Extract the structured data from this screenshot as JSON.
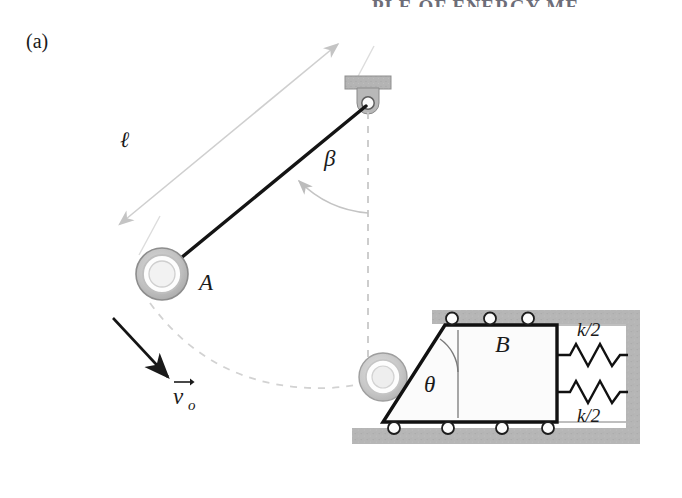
{
  "figure": {
    "panel_label": "(a)",
    "header_fragment": "PLE OF ENERGY ME",
    "caption_note": ""
  },
  "labels": {
    "length": "ℓ",
    "beta": "β",
    "theta": "θ",
    "ball": "A",
    "block": "B",
    "velocity": "v",
    "velocity_subscript": "o",
    "spring_top": "k/2",
    "spring_bottom": "k/2"
  },
  "colors": {
    "ink": "#1a1a1a",
    "hatch_gray": "#b3b3b3",
    "support_gray": "#b0b0b0",
    "dimension_gray": "#cfcfcf",
    "dashed_gray": "#c8c8c8",
    "ball_outer": "#bdbdbd",
    "ball_inner": "#f7f7f7",
    "block_fill": "#fbfbfb",
    "header_gray": "#6d6d78",
    "page_white": "#ffffff"
  },
  "geometry": {
    "pivot": {
      "x": 368,
      "y": 103
    },
    "ball_a": {
      "x": 162,
      "y": 274,
      "r_outer": 26,
      "r_mid": 19,
      "r_inner": 13
    },
    "ball_ghost": {
      "x": 383,
      "y": 377,
      "r_outer": 24,
      "r_mid": 17,
      "r_inner": 11
    },
    "rod": {
      "x1": 368,
      "y1": 103,
      "x2": 168,
      "y2": 268
    },
    "support_plate": {
      "x": 345,
      "y": 76,
      "w": 46,
      "h": 13
    },
    "enclosure": {
      "ceiling": {
        "x": 432,
        "y": 310,
        "w": 208,
        "h": 14
      },
      "floor": {
        "x": 352,
        "y": 428,
        "w": 288,
        "h": 16
      },
      "right_wall": {
        "x": 626,
        "y": 310,
        "w": 14,
        "h": 134
      }
    },
    "block_b": {
      "top_left": {
        "x": 445,
        "y": 325
      },
      "top_right": {
        "x": 557,
        "y": 325
      },
      "bottom_right": {
        "x": 557,
        "y": 422
      },
      "bottom_left": {
        "x": 383,
        "y": 422
      }
    },
    "rollers_top": [
      452,
      490,
      528
    ],
    "rollers_bottom": [
      394,
      448,
      502,
      548
    ],
    "springs": [
      {
        "y": 355,
        "x_start": 560,
        "x_end": 626,
        "coils": 5
      },
      {
        "y": 392,
        "x_start": 560,
        "x_end": 626,
        "coils": 5
      }
    ]
  },
  "annotations": {
    "dimension_line": "double-headed arrow marking rod length",
    "beta_arc": "angle from vertical dashed line to rod",
    "theta_arc": "angle from vertical reference to inclined face",
    "trajectory": "dashed arc from ball A to contact point",
    "velocity_arrow": "initial velocity direction of ball A"
  }
}
